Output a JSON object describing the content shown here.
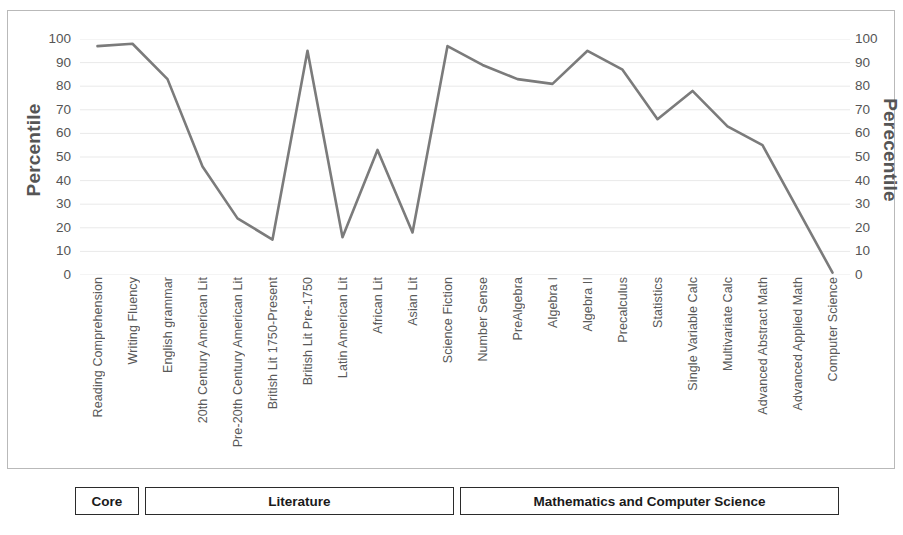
{
  "axes": {
    "y_left_title": "Percentile",
    "y_right_title": "Perecentile",
    "ticks": [
      "100",
      "90",
      "80",
      "70",
      "60",
      "50",
      "40",
      "30",
      "20",
      "10",
      "0"
    ]
  },
  "groups": [
    {
      "label": "Core"
    },
    {
      "label": "Literature"
    },
    {
      "label": "Mathematics and Computer Science"
    }
  ],
  "chart_data": {
    "type": "line",
    "title": "",
    "xlabel": "",
    "ylabel": "Percentile",
    "ylim": [
      0,
      100
    ],
    "ytick_step": 10,
    "grid": true,
    "line_color": "#7b7b7b",
    "categories": [
      "Reading Comprehension",
      "Writing Fluency",
      "English grammar",
      "20th Century American Lit",
      "Pre-20th Century American Lit",
      "British Lit 1750-Present",
      "British Lit Pre-1750",
      "Latin American Lit",
      "African Lit",
      "Asian Lit",
      "Science Fiction",
      "Number Sense",
      "PreAlgebra",
      "Algebra I",
      "Algebra II",
      "Precalculus",
      "Statistics",
      "Single Variable Calc",
      "Multivariate Calc",
      "Advanced Abstract Math",
      "Advanced Applied Math",
      "Computer Science"
    ],
    "values": [
      97,
      98,
      83,
      46,
      24,
      15,
      95,
      16,
      53,
      18,
      97,
      89,
      83,
      81,
      95,
      87,
      66,
      78,
      63,
      55,
      28,
      1
    ],
    "series": [
      {
        "name": "Percentile",
        "values": [
          97,
          98,
          83,
          46,
          24,
          15,
          95,
          16,
          53,
          18,
          97,
          89,
          83,
          81,
          95,
          87,
          66,
          78,
          63,
          55,
          28,
          1
        ]
      }
    ],
    "group_spans": [
      {
        "label": "Core",
        "start": 0,
        "end": 1
      },
      {
        "label": "Literature",
        "start": 2,
        "end": 10
      },
      {
        "label": "Mathematics and Computer Science",
        "start": 11,
        "end": 21
      }
    ]
  }
}
